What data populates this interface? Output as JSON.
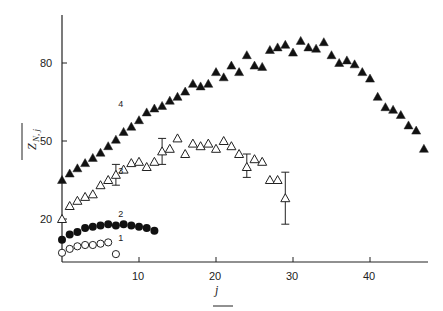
{
  "chart_data": {
    "type": "scatter",
    "title": "",
    "xlabel": "j",
    "ylabel": "Z_{N, j} (overlined)",
    "xlim": [
      0,
      47
    ],
    "ylim": [
      3.5,
      100
    ],
    "xticks": [
      10,
      20,
      30,
      40
    ],
    "yticks": [
      20,
      50,
      80
    ],
    "grid": false,
    "legend": "inline numeric labels 1-4 next to each series",
    "series": [
      {
        "name": "1",
        "marker": "open-circle",
        "points": [
          [
            0,
            7
          ],
          [
            1,
            8.5
          ],
          [
            2,
            9.5
          ],
          [
            3,
            10
          ],
          [
            4,
            10
          ],
          [
            5,
            10.5
          ],
          [
            6,
            11
          ],
          [
            7,
            6.5
          ]
        ]
      },
      {
        "name": "2",
        "marker": "filled-circle",
        "points": [
          [
            0,
            12
          ],
          [
            1,
            14
          ],
          [
            2,
            15
          ],
          [
            3,
            16.5
          ],
          [
            4,
            17
          ],
          [
            5,
            17.5
          ],
          [
            6,
            18
          ],
          [
            7,
            17.5
          ],
          [
            8,
            18
          ],
          [
            9,
            17.5
          ],
          [
            10,
            17
          ],
          [
            11,
            16.5
          ],
          [
            12,
            15.5
          ]
        ]
      },
      {
        "name": "3",
        "marker": "open-triangle",
        "points": [
          [
            0,
            20
          ],
          [
            1,
            25
          ],
          [
            2,
            27
          ],
          [
            3,
            28.5
          ],
          [
            4,
            29.5
          ],
          [
            5,
            33
          ],
          [
            6,
            35
          ],
          [
            7,
            37
          ],
          [
            8,
            39
          ],
          [
            9,
            41.5
          ],
          [
            10,
            42
          ],
          [
            11,
            40
          ],
          [
            12,
            42
          ],
          [
            13,
            46
          ],
          [
            14,
            47
          ],
          [
            15,
            51
          ],
          [
            16,
            45
          ],
          [
            17,
            49
          ],
          [
            18,
            48
          ],
          [
            19,
            49
          ],
          [
            20,
            47
          ],
          [
            21,
            50
          ],
          [
            22,
            48
          ],
          [
            23,
            45
          ],
          [
            24,
            40
          ],
          [
            25,
            43
          ],
          [
            26,
            42
          ],
          [
            27,
            35
          ],
          [
            28,
            35
          ],
          [
            29,
            28
          ]
        ],
        "error_bars": [
          {
            "x": 7,
            "y": 37,
            "lo": 33,
            "hi": 41
          },
          {
            "x": 13,
            "y": 46,
            "lo": 41,
            "hi": 51
          },
          {
            "x": 24,
            "y": 40,
            "lo": 36,
            "hi": 45
          },
          {
            "x": 29,
            "y": 28,
            "lo": 18,
            "hi": 38
          }
        ]
      },
      {
        "name": "4",
        "marker": "filled-triangle",
        "points": [
          [
            0,
            35
          ],
          [
            1,
            37.5
          ],
          [
            2,
            39.5
          ],
          [
            3,
            41.5
          ],
          [
            4,
            43.5
          ],
          [
            5,
            45.5
          ],
          [
            6,
            48
          ],
          [
            7,
            50.5
          ],
          [
            8,
            53.5
          ],
          [
            9,
            55.5
          ],
          [
            10,
            58
          ],
          [
            11,
            61
          ],
          [
            12,
            62.5
          ],
          [
            13,
            63.5
          ],
          [
            14,
            65.5
          ],
          [
            15,
            67
          ],
          [
            16,
            69
          ],
          [
            17,
            72
          ],
          [
            18,
            71
          ],
          [
            19,
            72
          ],
          [
            20,
            76.5
          ],
          [
            21,
            74.5
          ],
          [
            22,
            79
          ],
          [
            23,
            76.5
          ],
          [
            24,
            83
          ],
          [
            25,
            79
          ],
          [
            26,
            78.5
          ],
          [
            27,
            85
          ],
          [
            28,
            86
          ],
          [
            29,
            87
          ],
          [
            30,
            84
          ],
          [
            31,
            88.5
          ],
          [
            32,
            86
          ],
          [
            33,
            85.5
          ],
          [
            34,
            88
          ],
          [
            35,
            83
          ],
          [
            36,
            80
          ],
          [
            37,
            81
          ],
          [
            38,
            79.5
          ],
          [
            39,
            76.5
          ],
          [
            40,
            74
          ],
          [
            41,
            67
          ],
          [
            42,
            63
          ],
          [
            43,
            62
          ],
          [
            44,
            60
          ],
          [
            45,
            56
          ],
          [
            46,
            54
          ],
          [
            47,
            47
          ]
        ]
      }
    ]
  },
  "labels": {
    "x_axis_title": "j",
    "y_axis_title": "Z",
    "y_axis_subscript": "N, j",
    "series_labels": [
      "1",
      "2",
      "3",
      "4"
    ],
    "x_ticks": [
      "10",
      "20",
      "30",
      "40"
    ],
    "y_ticks": [
      "20",
      "50",
      "80"
    ]
  }
}
